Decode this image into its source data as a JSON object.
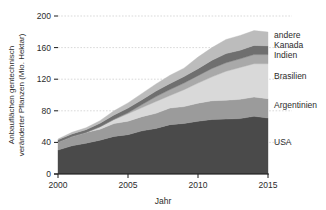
{
  "chart_data": {
    "type": "area",
    "title": "",
    "subtitle": "",
    "xlabel": "Jahr",
    "ylabel_line1": "Anbauflächen gentechnisch",
    "ylabel_line2": "veränderter Pflanzen (Mio. Hektar)",
    "stacked": true,
    "grid": true,
    "legend_position": "right-inline",
    "x": [
      2000,
      2001,
      2002,
      2003,
      2004,
      2005,
      2006,
      2007,
      2008,
      2009,
      2010,
      2011,
      2012,
      2013,
      2014,
      2015
    ],
    "xlim": [
      2000,
      2015
    ],
    "ylim": [
      0,
      200
    ],
    "xticks": [
      2000,
      2005,
      2010,
      2015
    ],
    "xtick_labels": [
      "2000",
      "2005",
      "2010",
      "2015"
    ],
    "yticks": [
      0,
      40,
      80,
      120,
      160,
      200
    ],
    "ytick_labels": [
      "0",
      "40",
      "80",
      "120",
      "160",
      "200"
    ],
    "series": [
      {
        "name": "USA",
        "color": "#4a4a4a",
        "values": [
          30.3,
          35.7,
          39.0,
          42.8,
          47.6,
          49.8,
          54.6,
          57.7,
          62.5,
          64.0,
          66.8,
          69.0,
          69.5,
          70.1,
          73.1,
          70.9
        ]
      },
      {
        "name": "Argentinien",
        "color": "#9b9b9b",
        "values": [
          10.0,
          11.8,
          13.5,
          13.9,
          16.2,
          17.1,
          18.0,
          19.1,
          21.0,
          21.3,
          22.9,
          23.7,
          23.9,
          24.4,
          24.3,
          24.5
        ]
      },
      {
        "name": "Brasilien",
        "color": "#d9d9d9",
        "values": [
          0.0,
          0.0,
          0.0,
          3.0,
          5.0,
          9.4,
          11.5,
          15.0,
          15.8,
          21.4,
          25.4,
          30.3,
          36.6,
          40.3,
          42.2,
          44.2
        ]
      },
      {
        "name": "Indien",
        "color": "#a9a9a9",
        "values": [
          0.0,
          0.0,
          0.1,
          0.1,
          0.5,
          1.3,
          3.8,
          6.2,
          7.6,
          8.4,
          9.4,
          10.6,
          10.8,
          11.0,
          11.6,
          11.6
        ]
      },
      {
        "name": "Kanada",
        "color": "#6f6f6f",
        "values": [
          3.0,
          3.2,
          3.5,
          4.4,
          5.4,
          5.8,
          6.1,
          7.0,
          7.6,
          8.2,
          8.8,
          10.4,
          11.6,
          10.8,
          11.6,
          11.0
        ]
      },
      {
        "name": "andere",
        "color": "#bcbcbc",
        "values": [
          1.0,
          2.1,
          2.4,
          3.3,
          5.3,
          6.6,
          8.0,
          9.0,
          10.5,
          10.7,
          14.7,
          16.0,
          17.9,
          18.7,
          18.7,
          17.5
        ]
      }
    ],
    "legend_labels": [
      "andere",
      "Kanada",
      "Indien",
      "Brasilien",
      "Argentinien",
      "USA"
    ]
  },
  "axis": {
    "x_title": "Jahr",
    "y_title_line1": "Anbauflächen gentechnisch",
    "y_title_line2": "veränderter Pflanzen (Mio. Hektar)"
  },
  "legend": {
    "items": [
      {
        "label": "andere",
        "color": "#bcbcbc",
        "y": 38
      },
      {
        "label": "Kanada",
        "color": "#6f6f6f",
        "y": 48
      },
      {
        "label": "Indien",
        "color": "#a9a9a9",
        "y": 58
      },
      {
        "label": "Brasilien",
        "color": "#d9d9d9",
        "y": 79
      },
      {
        "label": "Argentinien",
        "color": "#9b9b9b",
        "y": 108
      },
      {
        "label": "USA",
        "color": "#4a4a4a",
        "y": 145
      }
    ]
  },
  "ticks": {
    "x": [
      "2000",
      "2005",
      "2010",
      "2015"
    ],
    "y": [
      "0",
      "40",
      "80",
      "120",
      "160",
      "200"
    ]
  },
  "colors": {
    "background": "#ffffff",
    "grid": "#c9c9c9",
    "axis": "#1a1a1a",
    "text": "#2b2b2b"
  }
}
